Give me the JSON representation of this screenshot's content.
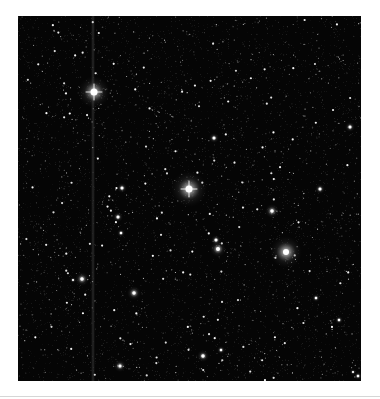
{
  "image": {
    "kind": "astronomical-star-field",
    "background": "#050505",
    "frame": {
      "x": 18,
      "y": 16,
      "width": 343,
      "height": 365
    },
    "bleed_column_x": 75,
    "bright_stars": [
      {
        "x": 76,
        "y": 76,
        "size": 7,
        "glow": 16,
        "spike": true
      },
      {
        "x": 171,
        "y": 173,
        "size": 7,
        "glow": 18,
        "spike": true
      },
      {
        "x": 268,
        "y": 236,
        "size": 6,
        "glow": 16,
        "spike": false
      },
      {
        "x": 254,
        "y": 195,
        "size": 3.5,
        "glow": 7,
        "spike": false
      },
      {
        "x": 200,
        "y": 233,
        "size": 4,
        "glow": 8,
        "spike": false
      },
      {
        "x": 198,
        "y": 224,
        "size": 3,
        "glow": 5,
        "spike": false
      },
      {
        "x": 64,
        "y": 263,
        "size": 3.5,
        "glow": 7,
        "spike": false
      },
      {
        "x": 55,
        "y": 264,
        "size": 2,
        "glow": 3,
        "spike": false
      },
      {
        "x": 116,
        "y": 277,
        "size": 3.5,
        "glow": 7,
        "spike": false
      },
      {
        "x": 104,
        "y": 172,
        "size": 3,
        "glow": 5,
        "spike": false
      },
      {
        "x": 100,
        "y": 201,
        "size": 3,
        "glow": 5,
        "spike": false
      },
      {
        "x": 103,
        "y": 217,
        "size": 2.5,
        "glow": 4,
        "spike": false
      },
      {
        "x": 196,
        "y": 122,
        "size": 3,
        "glow": 5,
        "spike": false
      },
      {
        "x": 332,
        "y": 111,
        "size": 3,
        "glow": 5,
        "spike": false
      },
      {
        "x": 302,
        "y": 173,
        "size": 3,
        "glow": 5,
        "spike": false
      },
      {
        "x": 185,
        "y": 340,
        "size": 3.5,
        "glow": 6,
        "spike": false
      },
      {
        "x": 203,
        "y": 334,
        "size": 2.5,
        "glow": 4,
        "spike": false
      },
      {
        "x": 102,
        "y": 350,
        "size": 3,
        "glow": 6,
        "spike": false
      },
      {
        "x": 298,
        "y": 282,
        "size": 2.5,
        "glow": 4,
        "spike": false
      },
      {
        "x": 321,
        "y": 304,
        "size": 2.5,
        "glow": 4,
        "spike": false
      },
      {
        "x": 340,
        "y": 360,
        "size": 2.5,
        "glow": 4,
        "spike": false
      },
      {
        "x": 335,
        "y": 356,
        "size": 2,
        "glow": 3,
        "spike": false
      }
    ],
    "faint_star_count": 1400,
    "random_seed": 7
  }
}
